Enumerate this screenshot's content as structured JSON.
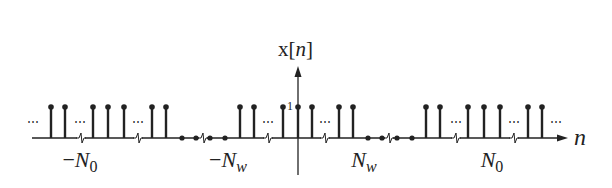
{
  "diagram": {
    "y_axis_label": {
      "prefix": "x[",
      "var": "n",
      "suffix": "]"
    },
    "x_axis_label": "n",
    "unit_tick_label": "1",
    "ellipsis": "⋯",
    "markers": [
      {
        "id": "neg-N0",
        "minus": "−",
        "sym": "N",
        "sub": "0",
        "x": 80
      },
      {
        "id": "neg-Nw",
        "minus": "−",
        "sym": "N",
        "sub": "w",
        "x": 228
      },
      {
        "id": "pos-Nw",
        "minus": "",
        "sym": "N",
        "sub": "w",
        "x": 364
      },
      {
        "id": "pos-N0",
        "minus": "",
        "sym": "N",
        "sub": "0",
        "x": 492
      }
    ],
    "stems_x": [
      51,
      65,
      93,
      108,
      124,
      152,
      166,
      240,
      254,
      283,
      298,
      312,
      339,
      353,
      426,
      440,
      468,
      484,
      500,
      528,
      542
    ],
    "zero_dots_x": [
      182,
      196,
      210,
      225,
      368,
      382,
      397,
      412
    ],
    "ellipses_x": [
      33,
      80,
      138,
      268,
      325,
      456,
      514,
      556
    ],
    "axis_breaks_x": [
      81,
      138,
      203,
      268,
      325,
      389,
      456,
      514
    ],
    "colors": {
      "line": "#222222",
      "background": "#ffffff"
    }
  }
}
